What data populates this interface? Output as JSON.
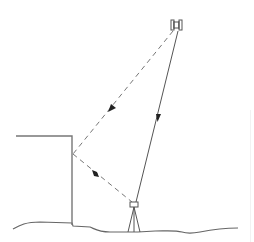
{
  "diagram": {
    "colors": {
      "line": "#555555",
      "dashed": "#777777",
      "ground": "#666666",
      "arrow": "#222222"
    },
    "elements": {
      "satellite": {
        "label": "satellite"
      },
      "building": {
        "label": "building / reflecting wall"
      },
      "receiver": {
        "label": "receiver on tripod"
      },
      "direct_path": {
        "label": "direct signal",
        "style": "solid"
      },
      "reflected_path": {
        "label": "reflected signal",
        "style": "dashed"
      },
      "ground": {
        "label": "ground"
      }
    }
  }
}
